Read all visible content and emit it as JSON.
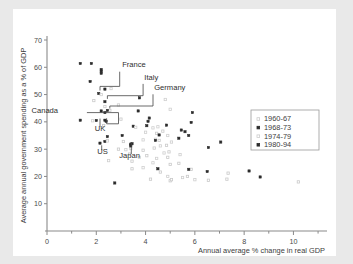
{
  "chart_data": {
    "type": "scatter",
    "title": "",
    "xlabel": "Annual average % change in real GDP",
    "ylabel": "Average annual government spending as a % of GDP",
    "xlim": [
      0,
      11.2
    ],
    "ylim": [
      0,
      70
    ],
    "xticks": [
      0,
      2,
      4,
      6,
      8,
      10
    ],
    "xticks_minor": [
      1,
      3,
      5,
      7,
      9,
      11
    ],
    "yticks": [
      10,
      20,
      30,
      40,
      50,
      60,
      70
    ],
    "grid": false,
    "legend_position": "right",
    "series": [
      {
        "name": "1960-67",
        "marker": "open-square",
        "color": "#c9c9c9",
        "points": [
          [
            1.9,
            47.8
          ],
          [
            2.35,
            45.6
          ],
          [
            2.55,
            44.2
          ],
          [
            3.0,
            41.0
          ],
          [
            2.3,
            38.6
          ],
          [
            2.45,
            33.2
          ],
          [
            3.1,
            32.8
          ],
          [
            2.9,
            30.0
          ],
          [
            3.35,
            28.2
          ],
          [
            3.45,
            25.6
          ],
          [
            3.9,
            29.6
          ],
          [
            4.05,
            27.6
          ],
          [
            4.35,
            30.4
          ],
          [
            4.4,
            33.6
          ],
          [
            4.55,
            33.2
          ],
          [
            4.85,
            31.4
          ],
          [
            4.95,
            29.0
          ],
          [
            5.0,
            24.4
          ],
          [
            4.6,
            21.6
          ],
          [
            4.2,
            19.0
          ],
          [
            5.0,
            18.4
          ],
          [
            5.05,
            18.8
          ],
          [
            5.7,
            20.0
          ],
          [
            5.85,
            22.6
          ],
          [
            6.55,
            18.6
          ],
          [
            7.3,
            19.0
          ],
          [
            7.35,
            21.2
          ],
          [
            10.2,
            18.0
          ],
          [
            4.45,
            35.8
          ],
          [
            4.7,
            36.6
          ],
          [
            5.35,
            24.8
          ],
          [
            4.9,
            27.0
          ],
          [
            3.45,
            22.8
          ]
        ]
      },
      {
        "name": "1968-73",
        "marker": "filled-square",
        "color": "#2b2b2b",
        "points": [
          [
            1.35,
            61.4
          ],
          [
            1.8,
            61.4
          ],
          [
            2.2,
            58.6
          ],
          [
            1.75,
            54.8
          ],
          [
            2.35,
            52.0
          ],
          [
            2.1,
            50.4
          ],
          [
            2.35,
            47.4
          ],
          [
            2.2,
            44.0
          ],
          [
            2.35,
            43.4
          ],
          [
            1.35,
            40.6
          ],
          [
            2.0,
            40.5
          ],
          [
            2.4,
            40.2
          ],
          [
            2.45,
            34.6
          ],
          [
            2.15,
            32.2
          ],
          [
            2.35,
            32.8
          ],
          [
            3.4,
            31.8
          ],
          [
            3.05,
            35.0
          ],
          [
            3.5,
            38.4
          ],
          [
            3.7,
            44.0
          ],
          [
            3.75,
            48.8
          ],
          [
            4.1,
            40.2
          ],
          [
            4.15,
            41.4
          ],
          [
            4.55,
            35.2
          ],
          [
            4.85,
            38.8
          ],
          [
            5.35,
            34.0
          ],
          [
            5.45,
            37.0
          ],
          [
            5.6,
            36.4
          ],
          [
            5.75,
            35.0
          ],
          [
            5.9,
            43.4
          ],
          [
            5.85,
            39.8
          ],
          [
            6.55,
            30.6
          ],
          [
            7.05,
            32.6
          ],
          [
            4.5,
            22.8
          ],
          [
            5.75,
            22.6
          ],
          [
            6.5,
            21.8
          ],
          [
            8.2,
            22.0
          ],
          [
            8.65,
            19.8
          ],
          [
            2.75,
            17.6
          ]
        ]
      },
      {
        "name": "1974-79",
        "marker": "open-square",
        "color": "#cfcfcf",
        "points": [
          [
            2.2,
            50.0
          ],
          [
            2.6,
            52.2
          ],
          [
            2.9,
            46.2
          ],
          [
            3.6,
            38.0
          ],
          [
            4.0,
            36.2
          ],
          [
            4.3,
            37.8
          ],
          [
            4.5,
            38.2
          ],
          [
            4.8,
            48.2
          ],
          [
            5.0,
            44.6
          ],
          [
            4.6,
            31.2
          ],
          [
            4.75,
            28.6
          ],
          [
            3.9,
            33.4
          ],
          [
            3.4,
            30.2
          ],
          [
            3.2,
            29.8
          ],
          [
            2.45,
            33.0
          ],
          [
            1.85,
            40.4
          ],
          [
            2.5,
            25.8
          ],
          [
            5.4,
            28.0
          ],
          [
            4.9,
            35.0
          ],
          [
            5.05,
            32.6
          ],
          [
            4.3,
            25.0
          ],
          [
            3.9,
            23.2
          ],
          [
            4.9,
            20.0
          ],
          [
            5.5,
            19.6
          ],
          [
            6.0,
            18.8
          ],
          [
            4.45,
            26.6
          ],
          [
            3.75,
            27.0
          ]
        ]
      },
      {
        "name": "1980-94",
        "marker": "filled-square",
        "color": "#2b2b2b",
        "points": [
          [
            2.2,
            59.2
          ],
          [
            2.2,
            57.8
          ],
          [
            2.45,
            44.2
          ],
          [
            3.45,
            32.0
          ],
          [
            3.4,
            31.2
          ],
          [
            4.05,
            38.6
          ],
          [
            4.4,
            33.2
          ],
          [
            2.35,
            40.6
          ]
        ]
      }
    ],
    "annotations": [
      {
        "label": "France",
        "x": 3.05,
        "y": 60.0
      },
      {
        "label": "Italy",
        "x": 3.95,
        "y": 55.4
      },
      {
        "label": "Germany",
        "x": 4.35,
        "y": 51.6
      },
      {
        "label": "Canada",
        "x": 0.45,
        "y": 43.4
      },
      {
        "label": "UK",
        "x": 2.15,
        "y": 36.8
      },
      {
        "label": "US",
        "x": 2.25,
        "y": 28.2
      },
      {
        "label": "Japan",
        "x": 3.35,
        "y": 26.8
      }
    ]
  },
  "legend": {
    "entries": [
      {
        "label": "1960-67",
        "marker": "open-square"
      },
      {
        "label": "1968-73",
        "marker": "filled-square"
      },
      {
        "label": "1974-79",
        "marker": "open-square"
      },
      {
        "label": "1980-94",
        "marker": "filled-square"
      }
    ]
  },
  "colors": {
    "background": "#e9e9e9",
    "card": "#ffffff",
    "axis": "#8a8a8a",
    "dark_marker": "#2b2b2b",
    "light_marker": "#cccccc",
    "text": "#3c3c3c"
  }
}
